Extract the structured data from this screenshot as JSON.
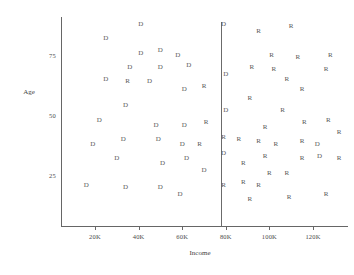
{
  "chart_data": {
    "type": "scatter",
    "title": "",
    "xlabel": "Income",
    "ylabel": "Age",
    "xtick_labels": [
      "20K",
      "40K",
      "60K",
      "80K",
      "100K",
      "120K"
    ],
    "xtick_values": [
      20000,
      40000,
      60000,
      80000,
      100000,
      120000
    ],
    "ytick_labels": [
      "75",
      "50",
      "25"
    ],
    "ytick_values": [
      75,
      50,
      25
    ],
    "xlim": [
      0,
      133000
    ],
    "ylim": [
      8,
      95
    ],
    "grid": false,
    "legend": null,
    "annotations": [
      {
        "name": "decision-boundary",
        "type": "vertical-line",
        "x_value": 80000,
        "label": "80K"
      }
    ],
    "marker_labels": [
      "D",
      "R"
    ],
    "series": [
      {
        "name": "D",
        "marker": "D",
        "points": [
          {
            "x": 41000,
            "y": 88
          },
          {
            "x": 25000,
            "y": 82
          },
          {
            "x": 41000,
            "y": 76
          },
          {
            "x": 50000,
            "y": 77
          },
          {
            "x": 36000,
            "y": 70
          },
          {
            "x": 50000,
            "y": 70
          },
          {
            "x": 25000,
            "y": 65
          },
          {
            "x": 45000,
            "y": 64
          },
          {
            "x": 58000,
            "y": 75
          },
          {
            "x": 63000,
            "y": 71
          },
          {
            "x": 79000,
            "y": 88
          },
          {
            "x": 80000,
            "y": 67
          },
          {
            "x": 61000,
            "y": 61
          },
          {
            "x": 80000,
            "y": 52
          },
          {
            "x": 34000,
            "y": 54
          },
          {
            "x": 22000,
            "y": 48
          },
          {
            "x": 48000,
            "y": 46
          },
          {
            "x": 61000,
            "y": 46
          },
          {
            "x": 33000,
            "y": 40
          },
          {
            "x": 49000,
            "y": 40
          },
          {
            "x": 60000,
            "y": 38
          },
          {
            "x": 19000,
            "y": 38
          },
          {
            "x": 30000,
            "y": 32
          },
          {
            "x": 51000,
            "y": 30
          },
          {
            "x": 62000,
            "y": 32
          },
          {
            "x": 79000,
            "y": 34
          },
          {
            "x": 70000,
            "y": 27
          },
          {
            "x": 16000,
            "y": 21
          },
          {
            "x": 34000,
            "y": 20
          },
          {
            "x": 50000,
            "y": 20
          },
          {
            "x": 59000,
            "y": 17
          },
          {
            "x": 123000,
            "y": 33
          },
          {
            "x": 122000,
            "y": 38
          }
        ]
      },
      {
        "name": "R",
        "marker": "R",
        "points": [
          {
            "x": 35000,
            "y": 64
          },
          {
            "x": 70000,
            "y": 62
          },
          {
            "x": 71000,
            "y": 47
          },
          {
            "x": 68000,
            "y": 38
          },
          {
            "x": 79000,
            "y": 41
          },
          {
            "x": 79000,
            "y": 21
          },
          {
            "x": 95000,
            "y": 85
          },
          {
            "x": 110000,
            "y": 87
          },
          {
            "x": 101000,
            "y": 75
          },
          {
            "x": 113000,
            "y": 74
          },
          {
            "x": 128000,
            "y": 75
          },
          {
            "x": 92000,
            "y": 70
          },
          {
            "x": 102000,
            "y": 69
          },
          {
            "x": 126000,
            "y": 69
          },
          {
            "x": 108000,
            "y": 65
          },
          {
            "x": 115000,
            "y": 61
          },
          {
            "x": 91000,
            "y": 57
          },
          {
            "x": 106000,
            "y": 52
          },
          {
            "x": 116000,
            "y": 47
          },
          {
            "x": 127000,
            "y": 48
          },
          {
            "x": 98000,
            "y": 45
          },
          {
            "x": 132000,
            "y": 43
          },
          {
            "x": 86000,
            "y": 40
          },
          {
            "x": 95000,
            "y": 39
          },
          {
            "x": 103000,
            "y": 38
          },
          {
            "x": 115000,
            "y": 39
          },
          {
            "x": 98000,
            "y": 33
          },
          {
            "x": 115000,
            "y": 32
          },
          {
            "x": 132000,
            "y": 32
          },
          {
            "x": 88000,
            "y": 30
          },
          {
            "x": 100000,
            "y": 26
          },
          {
            "x": 108000,
            "y": 26
          },
          {
            "x": 88000,
            "y": 22
          },
          {
            "x": 95000,
            "y": 21
          },
          {
            "x": 91000,
            "y": 15
          },
          {
            "x": 109000,
            "y": 16
          },
          {
            "x": 126000,
            "y": 17
          }
        ]
      }
    ]
  }
}
